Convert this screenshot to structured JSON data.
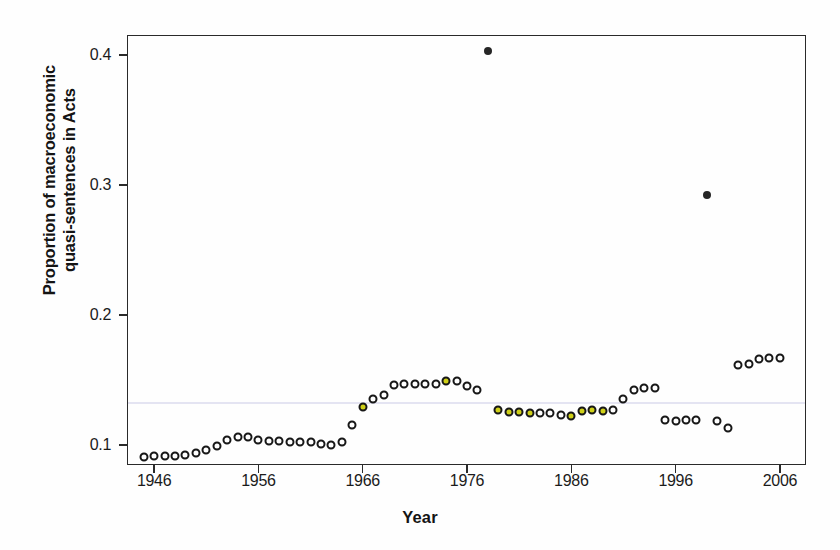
{
  "figure": {
    "background": "#ffffff",
    "frame_color": "#2a2a2a"
  },
  "chart_data": {
    "type": "scatter",
    "title": "",
    "xlabel": "Year",
    "ylabel": "Proportion of macroeconomic quasi-sentences in Acts",
    "ylabel_line1": "Proportion of macroeconomic",
    "ylabel_line2": "quasi-sentences in Acts",
    "xlim": [
      1943.4,
      2008.5
    ],
    "ylim": [
      0.0845,
      0.4155
    ],
    "xticks": [
      1946,
      1956,
      1966,
      1976,
      1986,
      1996,
      2006
    ],
    "xticklabels": [
      "1946",
      "1956",
      "1966",
      "1976",
      "1986",
      "1996",
      "2006"
    ],
    "yticks": [
      0.1,
      0.2,
      0.3,
      0.4
    ],
    "yticklabels": [
      "0.1",
      "0.2",
      "0.3",
      "0.4"
    ],
    "grid": false,
    "legend": "none",
    "marker": "open-circle",
    "marker_size_px": 9,
    "reference_line": {
      "orientation": "horizontal",
      "y": 0.133,
      "color": "#e4e4f2"
    },
    "series": [
      {
        "name": "Proportion of macroeconomic quasi-sentences in Acts",
        "point_color": "#171717",
        "point_fill": "#ffffff",
        "highlight_fill": "#cfd018",
        "outlier_fill": "#262626",
        "x": [
          1945,
          1946,
          1947,
          1948,
          1949,
          1950,
          1951,
          1952,
          1953,
          1954,
          1955,
          1956,
          1957,
          1958,
          1959,
          1960,
          1961,
          1962,
          1963,
          1964,
          1965,
          1966,
          1967,
          1968,
          1969,
          1970,
          1971,
          1972,
          1973,
          1974,
          1975,
          1976,
          1977,
          1978,
          1979,
          1980,
          1981,
          1982,
          1983,
          1984,
          1985,
          1986,
          1987,
          1988,
          1989,
          1990,
          1991,
          1992,
          1993,
          1994,
          1995,
          1996,
          1997,
          1998,
          1999,
          2000,
          2001,
          2002,
          2003,
          2004,
          2005,
          2006
        ],
        "y": [
          0.091,
          0.0912,
          0.0913,
          0.0916,
          0.092,
          0.094,
          0.0962,
          0.099,
          0.104,
          0.106,
          0.1058,
          0.104,
          0.1032,
          0.1028,
          0.1024,
          0.1022,
          0.102,
          0.101,
          0.1002,
          0.102,
          0.115,
          0.129,
          0.1355,
          0.138,
          0.146,
          0.147,
          0.1468,
          0.147,
          0.1472,
          0.149,
          0.149,
          0.1455,
          0.142,
          0.403,
          0.127,
          0.1255,
          0.125,
          0.1248,
          0.1248,
          0.1242,
          0.123,
          0.1222,
          0.1258,
          0.1268,
          0.126,
          0.1265,
          0.135,
          0.142,
          0.144,
          0.144,
          0.119,
          0.1185,
          0.119,
          0.119,
          0.292,
          0.1185,
          0.113,
          0.1615,
          0.1625,
          0.166,
          0.1668,
          0.167
        ],
        "styles": [
          "open",
          "open",
          "open",
          "open",
          "open",
          "open",
          "open",
          "open",
          "open",
          "open",
          "open",
          "open",
          "open",
          "open",
          "open",
          "open",
          "open",
          "open",
          "open",
          "open",
          "open",
          "fill",
          "open",
          "open",
          "open",
          "open",
          "open",
          "open",
          "open",
          "fill",
          "open",
          "open",
          "open",
          "solid",
          "fill",
          "fill",
          "fill",
          "fill",
          "open",
          "open",
          "open",
          "fill",
          "fill",
          "fill",
          "fill",
          "open",
          "open",
          "open",
          "open",
          "open",
          "open",
          "open",
          "open",
          "open",
          "solid",
          "open",
          "open",
          "open",
          "open",
          "open",
          "open",
          "open"
        ]
      }
    ]
  }
}
